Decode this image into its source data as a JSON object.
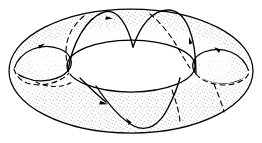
{
  "figure": {
    "kind": "torus-illustration",
    "alt_text": "A torus seen in oblique projection, shaded with a fine stipple texture, crossed by closed curves with arrows indicating direction",
    "background_color": "#ffffff",
    "ink_color": "#000000",
    "stipple_color": "#8c8c8c",
    "surface_fill": "#f2f2f2",
    "hole_fill": "#ffffff",
    "canvas": {
      "width": 262,
      "height": 143
    },
    "geometry": {
      "outer_ellipse": {
        "cx": 131,
        "cy": 71,
        "rx": 122,
        "ry": 62
      },
      "inner_hole_ellipse": {
        "cx": 131,
        "cy": 66,
        "rx": 64,
        "ry": 26
      },
      "tube_thickness": 58
    },
    "curve_count": 5,
    "arrow_count": 5,
    "dashed_segments": 5,
    "labels": []
  }
}
